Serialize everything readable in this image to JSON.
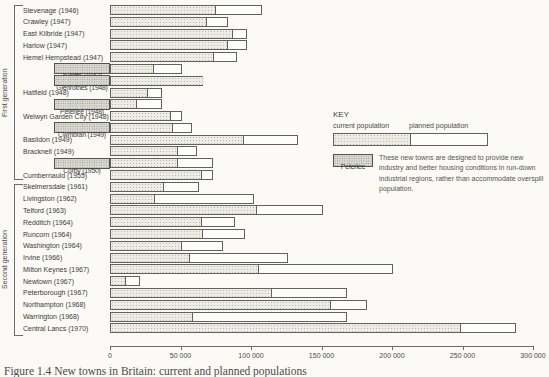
{
  "chart_data": {
    "type": "bar",
    "orientation": "horizontal",
    "xlabel_unit": "population",
    "xlim": [
      0,
      300000
    ],
    "x_ticks": [
      0,
      50000,
      100000,
      150000,
      200000,
      250000,
      300000
    ],
    "x_tick_labels": [
      "0",
      "50 000",
      "100 000",
      "150 000",
      "200 000",
      "250 000",
      "300 000"
    ],
    "grid": false,
    "legend_position": "right",
    "series_meaning": {
      "shaded": "current population",
      "white_extension": "planned population"
    },
    "groups": [
      {
        "label": "First generation",
        "towns": [
          {
            "name": "Stevenage (1946)",
            "current": 75000,
            "planned": 108000,
            "highlighted": false
          },
          {
            "name": "Crawley (1947)",
            "current": 69000,
            "planned": 84000,
            "highlighted": false
          },
          {
            "name": "East Kilbride (1947)",
            "current": 87000,
            "planned": 97000,
            "highlighted": false
          },
          {
            "name": "Harlow (1947)",
            "current": 84000,
            "planned": 97000,
            "highlighted": false
          },
          {
            "name": "Hemel Hempstead (1947)",
            "current": 74000,
            "planned": 90000,
            "highlighted": false
          },
          {
            "name": "Aycliffe (1947)",
            "current": 31000,
            "planned": 51000,
            "highlighted": true
          },
          {
            "name": "Glenrothes (1948)",
            "current": 66000,
            "planned": 66000,
            "highlighted": true
          },
          {
            "name": "Hatfield (1948)",
            "current": 27000,
            "planned": 37000,
            "highlighted": false
          },
          {
            "name": "Peterlee (1948)",
            "current": 19000,
            "planned": 37000,
            "highlighted": true
          },
          {
            "name": "Welwyn Garden City (1948)",
            "current": 43000,
            "planned": 51000,
            "highlighted": false
          },
          {
            "name": "Cwmbran (1949)",
            "current": 45000,
            "planned": 58000,
            "highlighted": true
          },
          {
            "name": "Basildon (1949)",
            "current": 95000,
            "planned": 133000,
            "highlighted": false
          },
          {
            "name": "Bracknell (1949)",
            "current": 48000,
            "planned": 62000,
            "highlighted": false
          },
          {
            "name": "Corby (1950)",
            "current": 48000,
            "planned": 73000,
            "highlighted": true
          },
          {
            "name": "Cumbernauld (1955)",
            "current": 65000,
            "planned": 73000,
            "highlighted": false
          }
        ]
      },
      {
        "label": "Second generation",
        "towns": [
          {
            "name": "Skelmersdale (1961)",
            "current": 38000,
            "planned": 63000,
            "highlighted": false
          },
          {
            "name": "Livingston (1962)",
            "current": 32000,
            "planned": 102000,
            "highlighted": false
          },
          {
            "name": "Telford (1963)",
            "current": 104000,
            "planned": 151000,
            "highlighted": false
          },
          {
            "name": "Redditch (1964)",
            "current": 65000,
            "planned": 89000,
            "highlighted": false
          },
          {
            "name": "Runcorn (1964)",
            "current": 66000,
            "planned": 96000,
            "highlighted": false
          },
          {
            "name": "Washington (1964)",
            "current": 51000,
            "planned": 80000,
            "highlighted": false
          },
          {
            "name": "Irvine (1966)",
            "current": 57000,
            "planned": 126000,
            "highlighted": false
          },
          {
            "name": "Milton Keynes (1967)",
            "current": 106000,
            "planned": 201000,
            "highlighted": false
          },
          {
            "name": "Newtown (1967)",
            "current": 11000,
            "planned": 21000,
            "highlighted": false
          },
          {
            "name": "Peterborough (1967)",
            "current": 115000,
            "planned": 168000,
            "highlighted": false
          },
          {
            "name": "Northampton (1968)",
            "current": 157000,
            "planned": 182000,
            "highlighted": false
          },
          {
            "name": "Warrington (1968)",
            "current": 59000,
            "planned": 168000,
            "highlighted": false
          },
          {
            "name": "Central Lancs (1970)",
            "current": 249000,
            "planned": 288000,
            "highlighted": false
          }
        ]
      }
    ]
  },
  "key": {
    "title": "KEY",
    "current_label": "current population",
    "planned_label": "planned population",
    "highlight_sample_label": "Peterlee",
    "note": "These new towns are designed to provide new industry and better housing conditions in run-down industrial regions, rather than accommodate overspill population."
  },
  "caption": "Figure 1.4 New towns in Britain: current and planned populations",
  "colors": {
    "page_background": "#fbfaf6",
    "bar_border": "#62625c",
    "current_fill": "#edece7",
    "current_dot": "#b9b8af",
    "planned_fill": "#fdfdfa",
    "hatch_fill": "#d9d8d0",
    "hatch_dot": "#8f8e85",
    "text": "#3d3d38"
  }
}
